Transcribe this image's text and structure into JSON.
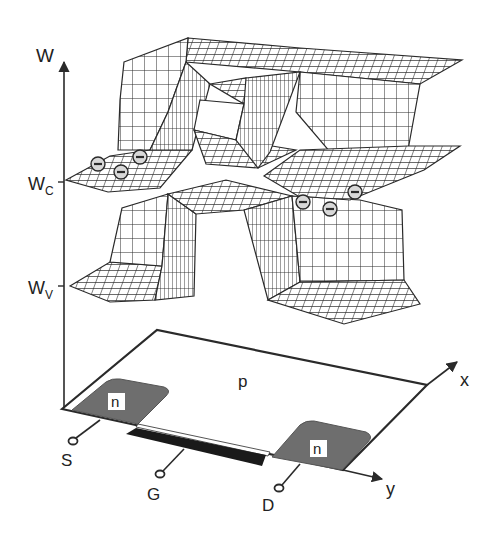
{
  "figure": {
    "type": "MOSFET band diagram (3D energy surface over n-channel transistor)",
    "axes": {
      "energy_axis_label": "W",
      "conduction_band_label": "W",
      "conduction_band_subscript": "C",
      "valence_band_label": "W",
      "valence_band_subscript": "V",
      "x_axis_label": "x",
      "y_axis_label": "y"
    },
    "substrate": {
      "label": "p"
    },
    "regions": [
      {
        "name": "source-region",
        "label": "n"
      },
      {
        "name": "drain-region",
        "label": "n"
      }
    ],
    "terminals": {
      "source": "S",
      "gate": "G",
      "drain": "D"
    },
    "electrons": {
      "symbol": "−",
      "left_group_count": 3,
      "right_group_count": 3
    },
    "colors": {
      "line": "#2a2a2a",
      "n_region_fill": "#6e6e6e",
      "gate_fill": "#1a1a1a",
      "mesh_fill": "#ffffff",
      "electron_fill": "#d8d8d8"
    }
  }
}
